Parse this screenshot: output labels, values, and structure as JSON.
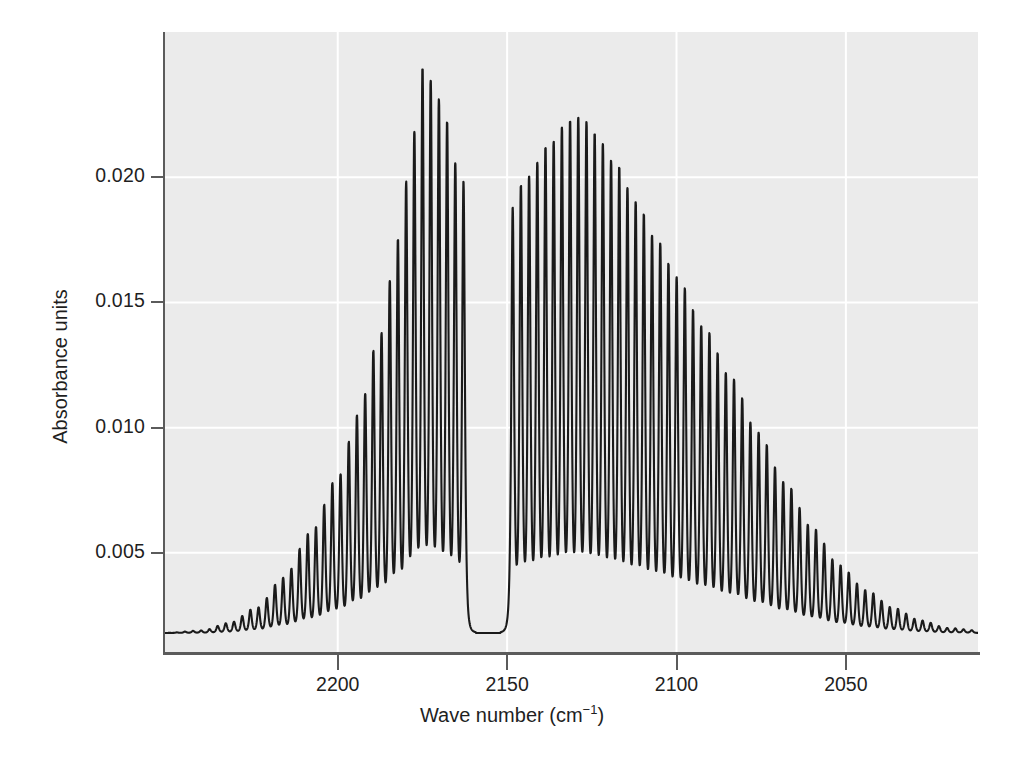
{
  "chart_data": {
    "type": "line",
    "title": "",
    "subtitle": "",
    "xlabel_text": "Wave number (cm",
    "xlabel_sup": "−1",
    "xlabel_tail": ")",
    "xlabel": "Wave number (cm−1)",
    "ylabel": "Absorbance units",
    "xticks": [
      2200,
      2150,
      2100,
      2050
    ],
    "xtick_labels": [
      "2200",
      "2150",
      "2100",
      "2050"
    ],
    "yticks": [
      0.005,
      0.01,
      0.015,
      0.02
    ],
    "ytick_labels": [
      "0.005",
      "0.010",
      "0.015",
      "0.020"
    ],
    "xlim": [
      2251,
      2011
    ],
    "ylim": [
      0.001,
      0.0258
    ],
    "x_axis_inverted": true,
    "grid": true,
    "grid_color": "#ffffff",
    "panel_background": "#ebebeb",
    "line_color": "#1a1a1a",
    "line_width": 2.1,
    "legend": null,
    "baseline": 0.0018,
    "line_spacing_cm1": 2.42,
    "bands": [
      {
        "name": "band-1",
        "band_center": 2173.0,
        "peak_absorbance": 0.0243,
        "peak_wavenumber": 2175.0,
        "envelope_width": 30.0,
        "gap_center": 2155.5,
        "gap_halfwidth": 5.5
      },
      {
        "name": "band-2",
        "band_center": 2127.0,
        "peak_absorbance": 0.0224,
        "peak_wavenumber": 2130.0,
        "envelope_width": 27.0,
        "gap_center": 2155.5,
        "gap_halfwidth": 5.5
      }
    ],
    "envelope_points": [
      {
        "x": 2251,
        "y": 0.0018
      },
      {
        "x": 2240,
        "y": 0.0019
      },
      {
        "x": 2232,
        "y": 0.0022
      },
      {
        "x": 2224,
        "y": 0.0028
      },
      {
        "x": 2216,
        "y": 0.004
      },
      {
        "x": 2208,
        "y": 0.0058
      },
      {
        "x": 2200,
        "y": 0.008
      },
      {
        "x": 2194,
        "y": 0.0105
      },
      {
        "x": 2188,
        "y": 0.0135
      },
      {
        "x": 2182,
        "y": 0.0175
      },
      {
        "x": 2178,
        "y": 0.0215
      },
      {
        "x": 2175,
        "y": 0.0243
      },
      {
        "x": 2172,
        "y": 0.0238
      },
      {
        "x": 2168,
        "y": 0.0222
      },
      {
        "x": 2164,
        "y": 0.02
      },
      {
        "x": 2160,
        "y": 0.019
      },
      {
        "x": 2150,
        "y": 0.0185
      },
      {
        "x": 2144,
        "y": 0.02
      },
      {
        "x": 2138,
        "y": 0.0212
      },
      {
        "x": 2132,
        "y": 0.0222
      },
      {
        "x": 2128,
        "y": 0.0224
      },
      {
        "x": 2124,
        "y": 0.0217
      },
      {
        "x": 2118,
        "y": 0.0205
      },
      {
        "x": 2112,
        "y": 0.019
      },
      {
        "x": 2106,
        "y": 0.0175
      },
      {
        "x": 2100,
        "y": 0.016
      },
      {
        "x": 2092,
        "y": 0.014
      },
      {
        "x": 2084,
        "y": 0.012
      },
      {
        "x": 2076,
        "y": 0.0098
      },
      {
        "x": 2068,
        "y": 0.0078
      },
      {
        "x": 2060,
        "y": 0.006
      },
      {
        "x": 2052,
        "y": 0.0045
      },
      {
        "x": 2044,
        "y": 0.0035
      },
      {
        "x": 2036,
        "y": 0.0028
      },
      {
        "x": 2028,
        "y": 0.0023
      },
      {
        "x": 2020,
        "y": 0.002
      },
      {
        "x": 2011,
        "y": 0.0019
      }
    ]
  }
}
